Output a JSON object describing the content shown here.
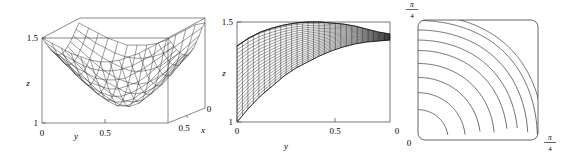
{
  "figure": {
    "title": "",
    "panel_count": 3,
    "line_color": "#000000",
    "axis_color": "#4a4a4a",
    "background": "#ffffff"
  },
  "chart_data": [
    {
      "type": "surface",
      "panel": "left",
      "name": "3d-surface-plot",
      "title": "",
      "xlabel": "x",
      "ylabel": "y",
      "zlabel": "z",
      "xlim": [
        0,
        0.5
      ],
      "ylim": [
        0,
        0.5
      ],
      "zlim": [
        1,
        1.5
      ],
      "x_ticks": [
        "0",
        "0.5"
      ],
      "y_ticks": [
        "0",
        "0.5"
      ],
      "z_ticks": [
        "1",
        "1.5"
      ],
      "x_tick_values": [
        0,
        0.5
      ],
      "y_tick_values": [
        0,
        0.5
      ],
      "z_tick_values": [
        1,
        1.5
      ],
      "grid": false,
      "legend": false,
      "mesh_rows": 14,
      "mesh_cols": 14,
      "description": "Saddle-like mesh surface rising from z=1 toward z=1.5 at the corners, drawn inside a wireframe bounding box",
      "surface_values": [
        [
          1.5,
          1.47,
          1.44,
          1.41,
          1.39,
          1.37,
          1.36,
          1.36,
          1.37,
          1.39,
          1.41,
          1.44,
          1.47,
          1.5
        ],
        [
          1.47,
          1.43,
          1.39,
          1.36,
          1.33,
          1.31,
          1.3,
          1.3,
          1.31,
          1.33,
          1.36,
          1.39,
          1.43,
          1.47
        ],
        [
          1.44,
          1.39,
          1.35,
          1.31,
          1.28,
          1.25,
          1.24,
          1.24,
          1.25,
          1.28,
          1.31,
          1.35,
          1.39,
          1.44
        ],
        [
          1.41,
          1.36,
          1.31,
          1.26,
          1.22,
          1.2,
          1.18,
          1.18,
          1.2,
          1.22,
          1.26,
          1.31,
          1.36,
          1.41
        ],
        [
          1.39,
          1.33,
          1.28,
          1.22,
          1.18,
          1.15,
          1.13,
          1.13,
          1.15,
          1.18,
          1.22,
          1.28,
          1.33,
          1.39
        ],
        [
          1.37,
          1.31,
          1.25,
          1.2,
          1.15,
          1.11,
          1.09,
          1.09,
          1.11,
          1.15,
          1.2,
          1.25,
          1.31,
          1.37
        ],
        [
          1.36,
          1.3,
          1.24,
          1.18,
          1.13,
          1.09,
          1.06,
          1.06,
          1.09,
          1.13,
          1.18,
          1.24,
          1.3,
          1.36
        ],
        [
          1.36,
          1.3,
          1.24,
          1.18,
          1.13,
          1.09,
          1.06,
          1.05,
          1.07,
          1.12,
          1.17,
          1.23,
          1.29,
          1.35
        ],
        [
          1.37,
          1.31,
          1.25,
          1.2,
          1.15,
          1.11,
          1.08,
          1.07,
          1.08,
          1.12,
          1.17,
          1.23,
          1.3,
          1.36
        ],
        [
          1.39,
          1.33,
          1.28,
          1.22,
          1.18,
          1.15,
          1.12,
          1.11,
          1.12,
          1.15,
          1.2,
          1.26,
          1.32,
          1.38
        ],
        [
          1.41,
          1.36,
          1.31,
          1.26,
          1.22,
          1.19,
          1.17,
          1.16,
          1.17,
          1.2,
          1.24,
          1.29,
          1.35,
          1.41
        ],
        [
          1.44,
          1.39,
          1.35,
          1.31,
          1.28,
          1.25,
          1.23,
          1.23,
          1.24,
          1.26,
          1.3,
          1.34,
          1.39,
          1.44
        ],
        [
          1.47,
          1.43,
          1.39,
          1.36,
          1.33,
          1.31,
          1.3,
          1.3,
          1.31,
          1.33,
          1.36,
          1.4,
          1.44,
          1.48
        ],
        [
          1.5,
          1.47,
          1.44,
          1.41,
          1.39,
          1.37,
          1.37,
          1.37,
          1.38,
          1.4,
          1.43,
          1.46,
          1.49,
          1.5
        ]
      ]
    },
    {
      "type": "line",
      "panel": "middle",
      "name": "edge-on-projection-plot",
      "title": "",
      "xlabel": "y",
      "ylabel": "z",
      "xlim": [
        0,
        0.78
      ],
      "ylim": [
        1,
        1.5
      ],
      "x_ticks": [
        "0",
        "0.5"
      ],
      "y_ticks": [
        "1",
        "1.5"
      ],
      "x_tick_values": [
        0,
        0.5
      ],
      "y_tick_values": [
        1,
        1.5
      ],
      "grid": false,
      "legend": false,
      "mesh_lines": 28,
      "description": "Edge-on view of the same surface: a dense hatched band between a lower curve rising from z=1 and an upper curve near z=1.5",
      "lower_curve": {
        "x": [
          0.0,
          0.06,
          0.12,
          0.18,
          0.24,
          0.3,
          0.36,
          0.42,
          0.48,
          0.54,
          0.6,
          0.66,
          0.72,
          0.78
        ],
        "y": [
          1.0,
          1.07,
          1.13,
          1.18,
          1.23,
          1.27,
          1.3,
          1.33,
          1.355,
          1.375,
          1.39,
          1.4,
          1.405,
          1.41
        ]
      },
      "upper_curve": {
        "x": [
          0.0,
          0.06,
          0.12,
          0.18,
          0.24,
          0.3,
          0.36,
          0.42,
          0.48,
          0.54,
          0.6,
          0.66,
          0.72,
          0.78
        ],
        "y": [
          1.38,
          1.42,
          1.45,
          1.47,
          1.485,
          1.495,
          1.5,
          1.5,
          1.495,
          1.49,
          1.48,
          1.465,
          1.45,
          1.44
        ]
      }
    },
    {
      "type": "contour",
      "panel": "right",
      "name": "contour-plot",
      "title": "",
      "xlabel": "",
      "ylabel": "",
      "xlim": [
        0,
        0.7853981634
      ],
      "ylim": [
        0,
        0.7853981634
      ],
      "x_ticks": [
        "0",
        "π/4"
      ],
      "y_ticks": [
        "0",
        "π/4"
      ],
      "x_tick_latex": [
        "0",
        "\\frac{\\pi}{4}"
      ],
      "y_tick_latex": [
        "0",
        "\\frac{\\pi}{4}"
      ],
      "x_tick_values": [
        0,
        0.7853981634
      ],
      "y_tick_values": [
        0,
        0.7853981634
      ],
      "grid": false,
      "legend": false,
      "contour_count": 9,
      "frame_rounded_corners": true,
      "description": "Nine nested hyperbola-like contour curves sweeping from the lower-left corner toward the upper-right, level sets of z increasing outward from the origin",
      "contour_levels": [
        1.02,
        1.05,
        1.09,
        1.14,
        1.2,
        1.26,
        1.33,
        1.41,
        1.47
      ]
    }
  ],
  "labels": {
    "panel1": {
      "z_axis": "z",
      "z_top": "1.5",
      "z_bottom": "1",
      "y_axis": "y",
      "y_origin": "0",
      "y_mid": "0.5",
      "x_axis": "x",
      "x_mid": "0.5",
      "x_origin": "0"
    },
    "panel2": {
      "z_axis": "z",
      "z_top": "1.5",
      "z_bottom": "1",
      "y_axis": "y",
      "y_origin": "0",
      "y_mid": "0.5",
      "y_end": "0"
    },
    "panel3": {
      "top_left_numerator": "π",
      "top_left_denominator": "4",
      "bottom_left": "0",
      "bottom_right_numerator": "π",
      "bottom_right_denominator": "4"
    }
  }
}
